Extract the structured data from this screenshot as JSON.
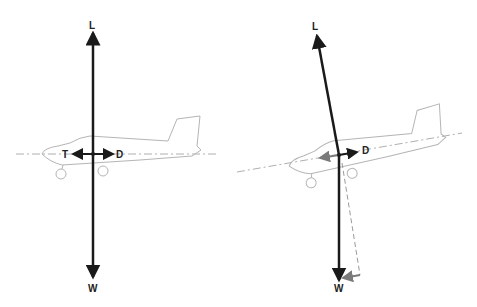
{
  "diagram": {
    "left_panel": {
      "description": "Level flight: forces in equilibrium",
      "labels": {
        "lift": "L",
        "weight": "W",
        "thrust": "T",
        "drag": "D"
      }
    },
    "right_panel": {
      "description": "Descent: lift tilted, weight component along flight path",
      "labels": {
        "lift": "L",
        "weight": "W",
        "drag": "D"
      }
    },
    "colors": {
      "force_arrow": "#1a1a1a",
      "aircraft_outline": "#b5b5b5",
      "axis_line": "#9a9a9a",
      "component_arrow": "#7a7a7a"
    }
  }
}
